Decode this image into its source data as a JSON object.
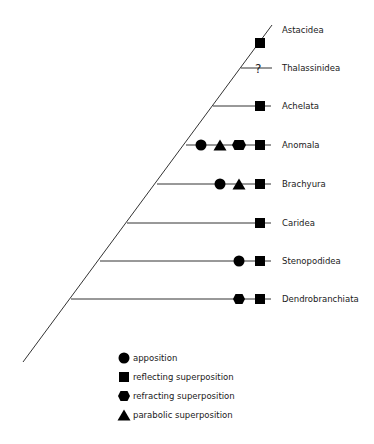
{
  "diagram": {
    "type": "phylogenetic-tree",
    "colors": {
      "line": "#333333",
      "marker": "#000000",
      "text": "#1a1a1a",
      "background": "#ffffff"
    },
    "taxa": [
      {
        "name": "Astacidea",
        "markers": [
          "reflecting"
        ]
      },
      {
        "name": "Thalassinidea",
        "markers": [
          "unknown"
        ],
        "unknown_symbol": "?"
      },
      {
        "name": "Achelata",
        "markers": [
          "reflecting"
        ]
      },
      {
        "name": "Anomala",
        "markers": [
          "apposition",
          "parabolic",
          "refracting",
          "reflecting"
        ]
      },
      {
        "name": "Brachyura",
        "markers": [
          "apposition",
          "parabolic",
          "reflecting"
        ]
      },
      {
        "name": "Caridea",
        "markers": [
          "reflecting"
        ]
      },
      {
        "name": "Stenopodidea",
        "markers": [
          "apposition",
          "reflecting"
        ]
      },
      {
        "name": "Dendrobranchiata",
        "markers": [
          "refracting",
          "reflecting"
        ]
      }
    ]
  },
  "legend": {
    "items": [
      {
        "shape": "circle",
        "icon": "circle-icon",
        "label": "apposition"
      },
      {
        "shape": "square",
        "icon": "square-icon",
        "label": "reflecting superposition"
      },
      {
        "shape": "hexagon",
        "icon": "hexagon-icon",
        "label": "refracting superposition"
      },
      {
        "shape": "triangle",
        "icon": "triangle-icon",
        "label": "parabolic superposition"
      }
    ]
  }
}
